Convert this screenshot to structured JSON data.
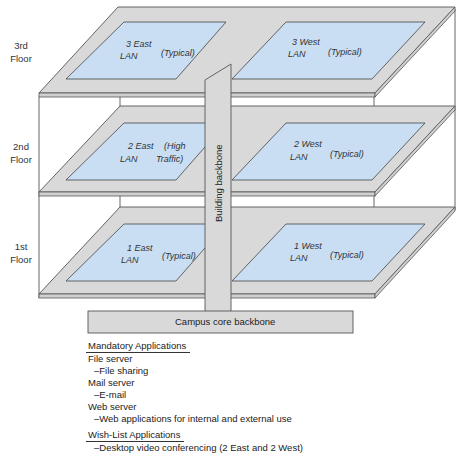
{
  "colors": {
    "slab": "#d9d9d9",
    "lan": "#c9def3",
    "outline": "#555555",
    "backbone": "#d9d9d9"
  },
  "floors": [
    {
      "label_line1": "3rd",
      "label_line2": "Floor",
      "east": {
        "name_line1": "3 East",
        "name_line2": "LAN",
        "note": "(Typical)"
      },
      "west": {
        "name_line1": "3 West",
        "name_line2": "LAN",
        "note": "(Typical)"
      }
    },
    {
      "label_line1": "2nd",
      "label_line2": "Floor",
      "east": {
        "name_line1": "2 East",
        "name_line2": "LAN",
        "note_line1": "(High",
        "note_line2": "Traffic)"
      },
      "west": {
        "name_line1": "2 West",
        "name_line2": "LAN",
        "note": "(Typical)"
      }
    },
    {
      "label_line1": "1st",
      "label_line2": "Floor",
      "east": {
        "name_line1": "1 East",
        "name_line2": "LAN",
        "note": "(Typical)"
      },
      "west": {
        "name_line1": "1 West",
        "name_line2": "LAN",
        "note": "(Typical)"
      }
    }
  ],
  "building_backbone": "Building backbone",
  "campus_core_backbone": "Campus core backbone",
  "applications": {
    "mandatory_header": "Mandatory Applications",
    "mandatory": [
      {
        "server": "File server",
        "use": "–File sharing"
      },
      {
        "server": "Mail server",
        "use": "–E-mail"
      },
      {
        "server": "Web server",
        "use": "–Web applications for internal and external use"
      }
    ],
    "wishlist_header": "Wish-List Applications",
    "wishlist": [
      "–Desktop video conferencing (2 East and 2 West)"
    ]
  }
}
